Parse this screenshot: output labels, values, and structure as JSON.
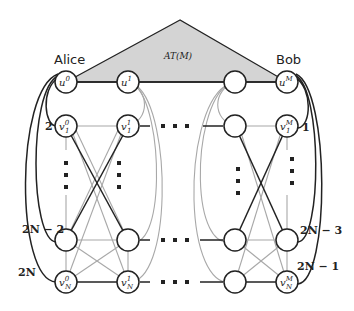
{
  "diagram": {
    "tree_label": "AT(M)",
    "left_player": "Alice",
    "right_player": "Bob",
    "colors": {
      "triangle_fill": "#d4d4d4",
      "dark_edge": "#222222",
      "light_edge": "#a8a8a8",
      "node_fill": "#ffffff"
    },
    "nodes": {
      "u0": {
        "base": "u",
        "sup": "0",
        "sub": ""
      },
      "u1": {
        "base": "u",
        "sup": "1",
        "sub": ""
      },
      "uM": {
        "base": "u",
        "sup": "M",
        "sub": ""
      },
      "v10": {
        "base": "v",
        "sup": "0",
        "sub": "1"
      },
      "v11": {
        "base": "v",
        "sup": "1",
        "sub": "1"
      },
      "v1M": {
        "base": "v",
        "sup": "M",
        "sub": "1"
      },
      "vN0": {
        "base": "v",
        "sup": "0",
        "sub": "N"
      },
      "vN1": {
        "base": "v",
        "sup": "1",
        "sub": "N"
      },
      "vNM": {
        "base": "v",
        "sup": "M",
        "sub": "N"
      }
    },
    "edge_labels": {
      "left_1": "2",
      "left_2": "2N − 2",
      "left_3": "2N",
      "right_1": "1",
      "right_2": "2N − 3",
      "right_3": "2N − 1"
    }
  }
}
